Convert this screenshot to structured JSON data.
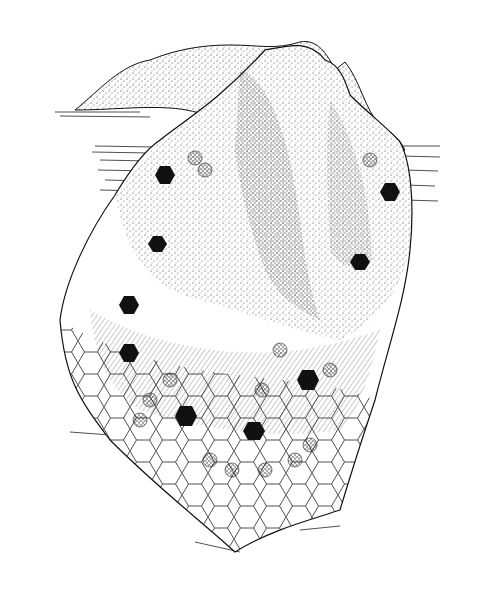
{
  "image": {
    "subject": "Pen-and-ink illustration of a hexagon-patterned quilt draped over an object",
    "style": "black and white stippled line drawing",
    "colors": {
      "background": "#ffffff",
      "ink": "#111111",
      "stipple": "#333333"
    },
    "motifs": {
      "solid_hexagons": 10,
      "pattern": "grandmother's flower garden hexagon rosettes"
    }
  }
}
